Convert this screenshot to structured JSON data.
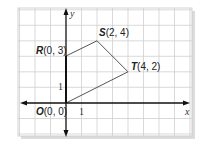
{
  "diagram": {
    "type": "coordinate-plane",
    "axes": {
      "x_label": "x",
      "y_label": "y"
    },
    "ticks": {
      "x_unit_label": "1",
      "y_unit_label": "1"
    },
    "points": [
      {
        "name": "O",
        "coords": "(0, 0)",
        "x": 0,
        "y": 0
      },
      {
        "name": "R",
        "coords": "(0, 3)",
        "x": 0,
        "y": 3
      },
      {
        "name": "S",
        "coords": "(2, 4)",
        "x": 2,
        "y": 4
      },
      {
        "name": "T",
        "coords": "(4, 2)",
        "x": 4,
        "y": 2
      }
    ],
    "polygon": "ORST",
    "colors": {
      "grid": "#c8c8c8",
      "axis": "#111111",
      "edge": "#555555",
      "shadow": "#d9d9d9"
    }
  }
}
